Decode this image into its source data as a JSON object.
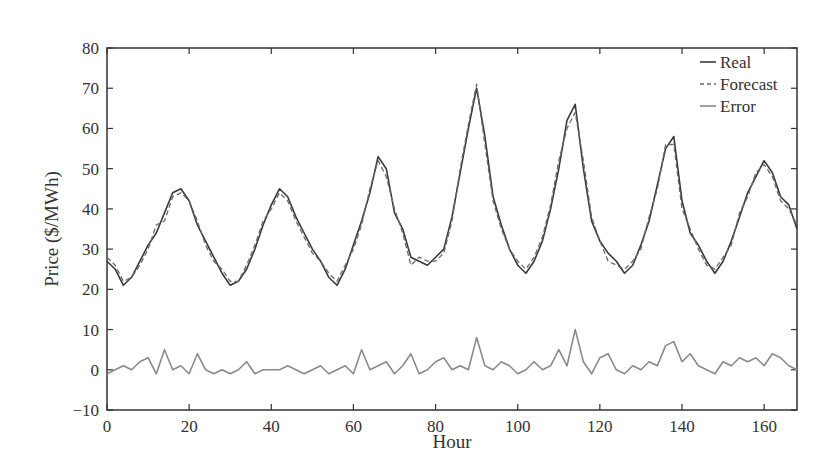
{
  "chart_data": {
    "type": "line",
    "title": "",
    "xlabel": "Hour",
    "ylabel": "Price ($/MWh)",
    "xlim": [
      0,
      168
    ],
    "ylim": [
      -10,
      80
    ],
    "x_ticks": [
      0,
      20,
      40,
      60,
      80,
      100,
      120,
      140,
      160
    ],
    "y_ticks": [
      -10,
      0,
      10,
      20,
      30,
      40,
      50,
      60,
      70,
      80
    ],
    "y_tick_labels": [
      "−10",
      "0",
      "10",
      "20",
      "30",
      "40",
      "50",
      "60",
      "70",
      "80"
    ],
    "grid": false,
    "legend_position": "upper right",
    "x": [
      0,
      2,
      4,
      6,
      8,
      10,
      12,
      14,
      16,
      18,
      20,
      22,
      24,
      26,
      28,
      30,
      32,
      34,
      36,
      38,
      40,
      42,
      44,
      46,
      48,
      50,
      52,
      54,
      56,
      58,
      60,
      62,
      64,
      66,
      68,
      70,
      72,
      74,
      76,
      78,
      80,
      82,
      84,
      86,
      88,
      90,
      92,
      94,
      96,
      98,
      100,
      102,
      104,
      106,
      108,
      110,
      112,
      114,
      116,
      118,
      120,
      122,
      124,
      126,
      128,
      130,
      132,
      134,
      136,
      138,
      140,
      142,
      144,
      146,
      148,
      150,
      152,
      154,
      156,
      158,
      160,
      162,
      164,
      166,
      168
    ],
    "series": [
      {
        "name": "Real",
        "style": "solid",
        "color": "#3a3a3a",
        "values": [
          27,
          25,
          21,
          23,
          27,
          31,
          34,
          39,
          44,
          45,
          42,
          36,
          32,
          28,
          24,
          21,
          22,
          25,
          30,
          36,
          41,
          45,
          43,
          38,
          34,
          30,
          27,
          23,
          21,
          25,
          31,
          37,
          44,
          53,
          50,
          39,
          35,
          28,
          27,
          26,
          28,
          30,
          38,
          49,
          60,
          70,
          58,
          43,
          36,
          30,
          26,
          24,
          27,
          32,
          40,
          50,
          62,
          66,
          50,
          37,
          32,
          29,
          27,
          24,
          26,
          31,
          37,
          46,
          55,
          58,
          42,
          34,
          31,
          27,
          24,
          27,
          32,
          38,
          44,
          48,
          52,
          49,
          43,
          41,
          35
        ]
      },
      {
        "name": "Forecast",
        "style": "dashed",
        "color": "#6a6a6a",
        "values": [
          28,
          26,
          22,
          23,
          26,
          30,
          36,
          37,
          43,
          44,
          42,
          37,
          31,
          27,
          25,
          22,
          22,
          26,
          31,
          37,
          40,
          44,
          42,
          37,
          33,
          29,
          27,
          24,
          22,
          26,
          30,
          36,
          45,
          52,
          48,
          40,
          34,
          26,
          28,
          27,
          27,
          29,
          37,
          50,
          61,
          71,
          56,
          42,
          35,
          30,
          27,
          25,
          28,
          33,
          41,
          52,
          60,
          64,
          52,
          38,
          32,
          27,
          26,
          25,
          27,
          30,
          38,
          45,
          56,
          56,
          40,
          35,
          30,
          26,
          25,
          28,
          31,
          39,
          43,
          49,
          51,
          48,
          42,
          40,
          36
        ]
      },
      {
        "name": "Error",
        "style": "solid",
        "color": "#8a8a8a",
        "values": [
          -1,
          0,
          1,
          0,
          2,
          3,
          -1,
          5,
          0,
          1,
          -1,
          4,
          0,
          -1,
          0,
          -1,
          0,
          2,
          -1,
          0,
          0,
          0,
          1,
          0,
          -1,
          0,
          1,
          -1,
          0,
          1,
          -1,
          5,
          0,
          1,
          2,
          -1,
          1,
          4,
          -1,
          0,
          2,
          3,
          0,
          1,
          0,
          8,
          1,
          0,
          2,
          1,
          -1,
          0,
          2,
          0,
          1,
          5,
          1,
          10,
          2,
          -1,
          3,
          4,
          0,
          -1,
          1,
          0,
          2,
          1,
          6,
          7,
          2,
          4,
          1,
          0,
          -1,
          2,
          1,
          3,
          2,
          3,
          1,
          4,
          3,
          1,
          0
        ]
      }
    ]
  },
  "legend": {
    "items": [
      {
        "label": "Real",
        "style": "solid"
      },
      {
        "label": "Forecast",
        "style": "dashed"
      },
      {
        "label": "Error",
        "style": "solid"
      }
    ]
  },
  "axes": {
    "x_title": "Hour",
    "y_title": "Price ($/MWh)"
  }
}
